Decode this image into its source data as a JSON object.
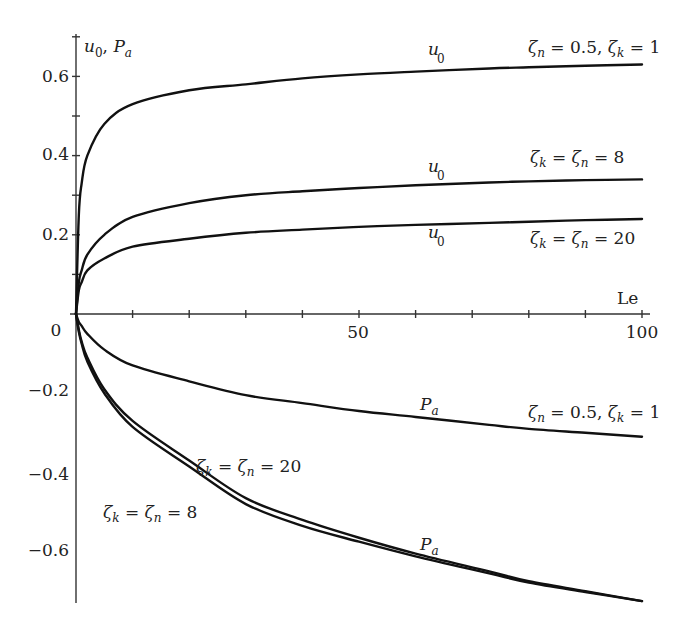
{
  "chart_data": {
    "type": "line",
    "title": "",
    "xlabel": "Le",
    "ylabel": "u0, Pa",
    "xlim": [
      0,
      100
    ],
    "ylim": [
      -0.75,
      0.7
    ],
    "grid": false,
    "legend": "inline annotations",
    "x_ticks": [
      0,
      10,
      20,
      30,
      40,
      50,
      60,
      70,
      80,
      90,
      100
    ],
    "x_tick_labels": [
      {
        "value": 0,
        "label": "0"
      },
      {
        "value": 50,
        "label": "50"
      },
      {
        "value": 100,
        "label": "100"
      }
    ],
    "y_ticks_positive": [
      0.1,
      0.2,
      0.3,
      0.4,
      0.5,
      0.6,
      0.7
    ],
    "y_tick_labels": [
      {
        "value": 0.6,
        "label": "0.6"
      },
      {
        "value": 0.4,
        "label": "0.4"
      },
      {
        "value": 0.2,
        "label": "0.2"
      },
      {
        "value": -0.2,
        "label": "−0.2"
      },
      {
        "value": -0.4,
        "label": "−0.4"
      },
      {
        "value": -0.6,
        "label": "−0.6"
      }
    ],
    "x": [
      0,
      0.5,
      1,
      2,
      5,
      10,
      20,
      30,
      40,
      50,
      60,
      73,
      80,
      90,
      100
    ],
    "series": [
      {
        "name": "u0, ζn=0.5, ζk=1",
        "values": [
          0,
          0.25,
          0.33,
          0.4,
          0.48,
          0.53,
          0.565,
          0.58,
          0.595,
          0.605,
          0.612,
          0.62,
          0.623,
          0.627,
          0.63
        ]
      },
      {
        "name": "u0, ζk=ζn=8",
        "values": [
          0,
          0.08,
          0.11,
          0.15,
          0.2,
          0.245,
          0.28,
          0.3,
          0.31,
          0.318,
          0.325,
          0.332,
          0.335,
          0.338,
          0.34
        ]
      },
      {
        "name": "u0, ζk=ζn=20",
        "values": [
          0,
          0.06,
          0.08,
          0.11,
          0.14,
          0.17,
          0.19,
          0.205,
          0.213,
          0.22,
          0.225,
          0.23,
          0.233,
          0.237,
          0.24
        ]
      },
      {
        "name": "Pa, ζn=0.5, ζk=1",
        "values": [
          0,
          -0.02,
          -0.03,
          -0.05,
          -0.09,
          -0.13,
          -0.17,
          -0.205,
          -0.225,
          -0.245,
          -0.26,
          -0.28,
          -0.29,
          -0.3,
          -0.31
        ]
      },
      {
        "name": "Pa, ζk=ζn=20",
        "values": [
          0,
          -0.04,
          -0.07,
          -0.11,
          -0.19,
          -0.27,
          -0.37,
          -0.465,
          -0.52,
          -0.565,
          -0.605,
          -0.65,
          -0.675,
          -0.7,
          -0.725
        ]
      },
      {
        "name": "Pa, ζk=ζn=8",
        "values": [
          0,
          -0.045,
          -0.075,
          -0.12,
          -0.2,
          -0.285,
          -0.385,
          -0.48,
          -0.535,
          -0.575,
          -0.612,
          -0.655,
          -0.678,
          -0.702,
          -0.725
        ]
      }
    ],
    "annotations": [
      {
        "text": "u0",
        "near": "top curve",
        "x": 62,
        "y": 0.66
      },
      {
        "text": "ζn = 0.5, ζk = 1",
        "near": "top curve end",
        "x": 80,
        "y": 0.66
      },
      {
        "text": "u0",
        "near": "ζ=8 curve",
        "x": 62,
        "y": 0.36
      },
      {
        "text": "ζk = ζn = 8",
        "near": "ζ=8 curve end",
        "x": 80,
        "y": 0.38
      },
      {
        "text": "u0",
        "near": "ζ=20 curve",
        "x": 62,
        "y": 0.2
      },
      {
        "text": "ζk = ζn = 20",
        "near": "ζ=20 curve end",
        "x": 80,
        "y": 0.2
      },
      {
        "text": "Pa",
        "near": "upper Pa curve",
        "x": 60,
        "y": -0.24
      },
      {
        "text": "ζn = 0.5, ζk = 1",
        "near": "upper Pa curve end",
        "x": 80,
        "y": -0.26
      },
      {
        "text": "ζk = ζn = 20",
        "near": "lower pair",
        "x": 21,
        "y": -0.4
      },
      {
        "text": "ζk = ζn = 8",
        "near": "lower pair",
        "x": 5,
        "y": -0.5
      },
      {
        "text": "Pa",
        "near": "lower pair",
        "x": 60,
        "y": -0.6
      }
    ]
  },
  "labels": {
    "x_axis": "Le",
    "y_axis_main": "u",
    "y_axis_sub0": "0",
    "y_axis_sep": ", ",
    "y_axis_p": "P",
    "y_axis_suba": "a",
    "u": "u",
    "u_sub": "0",
    "p": "P",
    "p_sub": "a",
    "zeta": "ζ",
    "sub_n": "n",
    "sub_k": "k",
    "eq": " = ",
    "val_05": "0.5, ",
    "val_1": "1",
    "val_8": "8",
    "val_20": "20",
    "origin": "0",
    "x50": "50",
    "x100": "100",
    "y06": "0.6",
    "y04": "0.4",
    "y02": "0.2",
    "ym02": "−0.2",
    "ym04": "−0.4",
    "ym06": "−0.6"
  }
}
